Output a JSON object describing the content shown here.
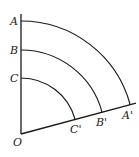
{
  "diagram": {
    "title": "",
    "origin": {
      "label": "O",
      "x": 21,
      "y": 134
    },
    "angle_deg": 15,
    "points": [
      {
        "label": "A",
        "prime": "A'",
        "radius": 113
      },
      {
        "label": "B",
        "prime": "B'",
        "radius": 84
      },
      {
        "label": "C",
        "prime": "C'",
        "radius": 56
      }
    ],
    "stroke_color": "#1a1a1a"
  }
}
